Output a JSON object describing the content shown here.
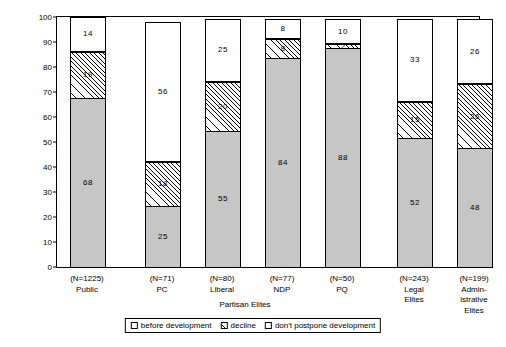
{
  "chart_data": {
    "type": "bar",
    "subtype": "stacked-bar-100",
    "title": "",
    "xlabel": "Partisan Elites",
    "ylabel": "Percentage",
    "ylim": [
      0,
      100
    ],
    "yticks": [
      0,
      10,
      20,
      30,
      40,
      50,
      60,
      70,
      80,
      90,
      100
    ],
    "grid": false,
    "legend_position": "bottom",
    "categories": [
      "Public",
      "PC",
      "Liberal",
      "NDP",
      "PQ",
      "Legal Elites",
      "Administrative Elites"
    ],
    "category_labels": [
      {
        "n": "(N=1225)",
        "lines": [
          "Public"
        ]
      },
      {
        "n": "(N=71)",
        "lines": [
          "PC"
        ]
      },
      {
        "n": "(N=80)",
        "lines": [
          "Liberal"
        ]
      },
      {
        "n": "(N=77)",
        "lines": [
          "NDP"
        ]
      },
      {
        "n": "(N=50)",
        "lines": [
          "PQ"
        ]
      },
      {
        "n": "(N=243)",
        "lines": [
          "Legal",
          "Elites"
        ]
      },
      {
        "n": "(N=199)",
        "lines": [
          "Admin-",
          "istrative",
          "Elites"
        ]
      }
    ],
    "series": [
      {
        "name": "before development",
        "pattern": "solid-gray",
        "color": "#c6c6c6",
        "values": [
          68,
          25,
          55,
          84,
          88,
          52,
          48
        ]
      },
      {
        "name": "decline",
        "pattern": "diagonal-hatch",
        "color": "#ffffff",
        "values": [
          19,
          18,
          20,
          8,
          2,
          15,
          26
        ]
      },
      {
        "name": "don't postpone development",
        "pattern": "open-white",
        "color": "#ffffff",
        "values": [
          14,
          56,
          25,
          8,
          10,
          33,
          26
        ]
      }
    ],
    "legend": [
      "before development",
      "decline",
      "don't postpone development"
    ]
  }
}
